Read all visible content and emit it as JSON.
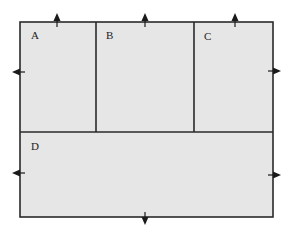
{
  "diagram": {
    "type": "floor-plan-partition",
    "outer": {
      "x": 20,
      "y": 22,
      "width": 253,
      "height": 195
    },
    "colors": {
      "fill": "#e6e6e6",
      "stroke": "#2a2a2a",
      "arrow": "#1a1a1a",
      "background": "#ffffff"
    },
    "regions": [
      {
        "id": "A",
        "label": "A",
        "x": 20,
        "y": 22,
        "width": 76,
        "height": 110,
        "label_pos": {
          "x": 31,
          "y": 30
        }
      },
      {
        "id": "B",
        "label": "B",
        "x": 96,
        "y": 22,
        "width": 98,
        "height": 110,
        "label_pos": {
          "x": 106,
          "y": 30
        }
      },
      {
        "id": "C",
        "label": "C",
        "x": 194,
        "y": 22,
        "width": 79,
        "height": 110,
        "label_pos": {
          "x": 204,
          "y": 31
        }
      },
      {
        "id": "D",
        "label": "D",
        "x": 20,
        "y": 132,
        "width": 253,
        "height": 85,
        "label_pos": {
          "x": 31,
          "y": 141
        }
      }
    ],
    "dividers": {
      "vertical": [
        {
          "x": 96,
          "y1": 22,
          "y2": 132
        },
        {
          "x": 194,
          "y1": 22,
          "y2": 132
        }
      ],
      "horizontal": [
        {
          "y": 132,
          "x1": 20,
          "x2": 273
        }
      ]
    },
    "arrows": [
      {
        "region": "A",
        "direction": "up",
        "x": 57,
        "y": 22
      },
      {
        "region": "B",
        "direction": "up",
        "x": 145,
        "y": 22
      },
      {
        "region": "C",
        "direction": "up",
        "x": 235,
        "y": 22
      },
      {
        "region": "A",
        "direction": "left",
        "x": 20,
        "y": 72
      },
      {
        "region": "C",
        "direction": "right",
        "x": 273,
        "y": 71
      },
      {
        "region": "D",
        "direction": "left",
        "x": 20,
        "y": 173
      },
      {
        "region": "D",
        "direction": "right",
        "x": 273,
        "y": 175
      },
      {
        "region": "D",
        "direction": "down",
        "x": 145,
        "y": 217
      }
    ]
  }
}
